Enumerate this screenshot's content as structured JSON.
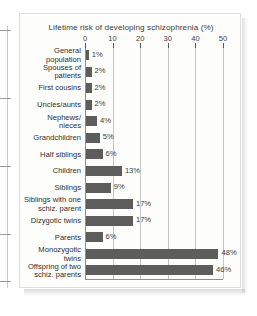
{
  "chart_data": {
    "type": "bar",
    "orientation": "horizontal",
    "title": "Lifetime risk of  developing schizophrenia (%)",
    "xlabel": "",
    "ylabel": "",
    "xlim": [
      0,
      50
    ],
    "xticks": [
      0,
      10,
      20,
      30,
      40,
      50
    ],
    "xtick_labels": [
      "0",
      "10",
      "20",
      "30",
      "40",
      "50"
    ],
    "grid": "vertical",
    "legend": "none",
    "value_suffix": "%",
    "bar_color": "#5d5d5d",
    "categories": [
      "General\npopulation",
      "Spouses of\npatients",
      "First cousins",
      "Uncles/aunts",
      "Nephews/\nnieces",
      "Grandchildren",
      "Half siblings",
      "Children",
      "Siblings",
      "Siblings with one\nschiz. parent",
      "Dizygotic twins",
      "Parents",
      "Monozygotic\ntwins",
      "Offspring of two\nschiz. parents"
    ],
    "values": [
      1,
      2,
      2,
      2,
      4,
      5,
      6,
      13,
      9,
      17,
      17,
      6,
      48,
      46
    ],
    "value_labels": [
      "1%",
      "2%",
      "2%",
      "2%",
      "4%",
      "5%",
      "6%",
      "13%",
      "9%",
      "17%",
      "17%",
      "6%",
      "48%",
      "46%"
    ]
  }
}
